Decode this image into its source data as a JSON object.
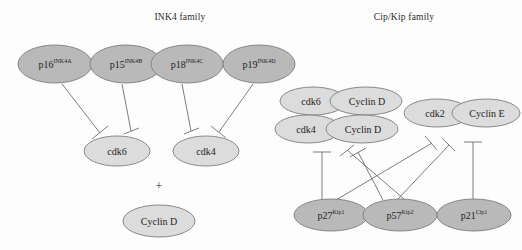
{
  "titles": {
    "ink4": "INK4 family",
    "cipkip": "Cip/Kip family"
  },
  "symbols": {
    "plus": "+"
  },
  "colors": {
    "inhibitor_fill": "#b9b9b9",
    "target_fill": "#dcdcdc",
    "stroke": "#7d7d7d",
    "edge": "#6e6e6e",
    "text": "#1d1d1d",
    "background": "#fdfdfd"
  },
  "nodes": {
    "p16": {
      "base": "p16",
      "sup": "INK4A"
    },
    "p15": {
      "base": "p15",
      "sup": "INK4B"
    },
    "p18": {
      "base": "p18",
      "sup": "INK4C"
    },
    "p19": {
      "base": "p19",
      "sup": "INK4D"
    },
    "cdk6_left": {
      "base": "cdk6",
      "sup": ""
    },
    "cdk4_left": {
      "base": "cdk4",
      "sup": ""
    },
    "cyclinD_left": {
      "base": "Cyclin D",
      "sup": ""
    },
    "cdk6_cx": {
      "base": "cdk6",
      "sup": ""
    },
    "cyclinD_cx1": {
      "base": "Cyclin D",
      "sup": ""
    },
    "cdk4_cx": {
      "base": "cdk4",
      "sup": ""
    },
    "cyclinD_cx2": {
      "base": "Cyclin D",
      "sup": ""
    },
    "cdk2_cx": {
      "base": "cdk2",
      "sup": ""
    },
    "cyclinE_cx": {
      "base": "Cyclin E",
      "sup": ""
    },
    "p27": {
      "base": "p27",
      "sup": "Kip1"
    },
    "p57": {
      "base": "p57",
      "sup": "Kip2"
    },
    "p21": {
      "base": "p21",
      "sup": "Cip1"
    }
  },
  "edges": [
    {
      "from": "p16",
      "to": "cdk6_left",
      "relation": "inhibits"
    },
    {
      "from": "p15",
      "to": "cdk6_left",
      "relation": "inhibits"
    },
    {
      "from": "p18",
      "to": "cdk4_left",
      "relation": "inhibits"
    },
    {
      "from": "p19",
      "to": "cdk4_left",
      "relation": "inhibits"
    },
    {
      "from": "p27",
      "to": "cdk4_cx",
      "relation": "inhibits"
    },
    {
      "from": "p27",
      "to": "cdk2_cx",
      "relation": "inhibits"
    },
    {
      "from": "p57",
      "to": "cdk4_cx",
      "relation": "inhibits"
    },
    {
      "from": "p57",
      "to": "cdk2_cx",
      "relation": "inhibits"
    },
    {
      "from": "p21",
      "to": "cdk2_cx",
      "relation": "inhibits"
    }
  ]
}
